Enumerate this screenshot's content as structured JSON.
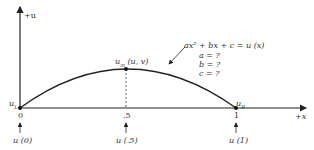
{
  "axes": {
    "y_label": "+u",
    "x_label": "+x"
  },
  "points": {
    "left": {
      "label": "u_L",
      "main": "u",
      "sub": "L",
      "tick": "0",
      "annotation": "u (0)"
    },
    "mid": {
      "label": "u_m (u, v)",
      "main": "u",
      "sub": "m",
      "suffix": " (u, v)",
      "tick": ".5",
      "annotation": "u (.5)"
    },
    "right": {
      "label": "u_R",
      "main": "u",
      "sub": "R",
      "tick": "1",
      "annotation": "u (1)"
    }
  },
  "equation": {
    "main": "ax² + bx + c = u (x)",
    "unknowns": [
      "a = ?",
      "b = ?",
      "c = ?"
    ]
  },
  "colors": {
    "line": "#222222",
    "dash": "#555555"
  }
}
